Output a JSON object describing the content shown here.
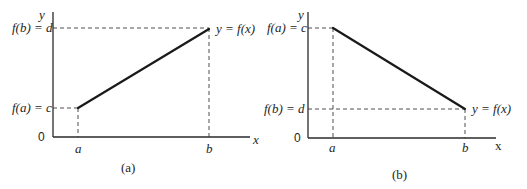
{
  "figures": [
    {
      "caption": "(a)",
      "y_axis_label": "y",
      "x_axis_label": "x",
      "origin_label": "0",
      "upper_value_label": "f(b) = d",
      "lower_value_label": "f(a) = c",
      "tick_a": "a",
      "tick_b": "b",
      "curve_label": "y = f(x)",
      "description": "Increasing linear function from (a, c) to (b, d)"
    },
    {
      "caption": "(b)",
      "y_axis_label": "y",
      "x_axis_label": "x",
      "origin_label": "0",
      "upper_value_label": "f(a) = c",
      "lower_value_label": "f(b) = d",
      "tick_a": "a",
      "tick_b": "b",
      "curve_label": "y = f(x)",
      "description": "Decreasing linear function from (a, c) to (b, d)"
    }
  ],
  "colors": {
    "ink": "#1e1e1e",
    "background": "#ffffff"
  }
}
